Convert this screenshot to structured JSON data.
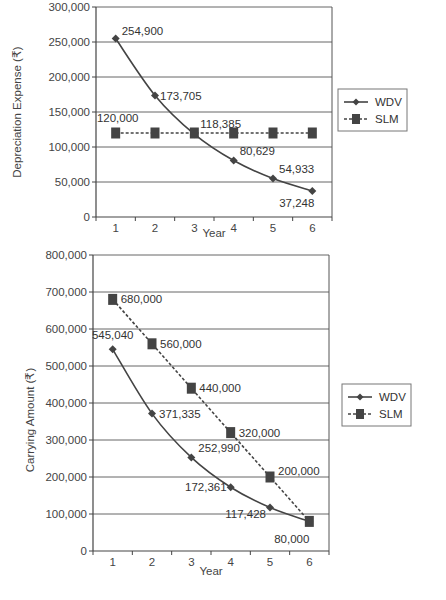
{
  "chart_data": [
    {
      "type": "line",
      "title": "",
      "xlabel": "Year",
      "ylabel": "Depreciation Expense (₹)",
      "categories": [
        "1",
        "2",
        "3",
        "4",
        "5",
        "6"
      ],
      "ylim": [
        0,
        300000
      ],
      "yticks": [
        "0",
        "50,000",
        "100,000",
        "150,000",
        "200,000",
        "250,000",
        "300,000"
      ],
      "grid": true,
      "legend_position": "right",
      "series": [
        {
          "name": "WDV",
          "style": "solid, diamond markers",
          "values": [
            254900,
            173705,
            118385,
            80629,
            54933,
            37248
          ],
          "labels": [
            "254,900",
            "173,705",
            "118,385",
            "80,629",
            "54,933",
            "37,248"
          ]
        },
        {
          "name": "SLM",
          "style": "dashed, square markers",
          "values": [
            120000,
            120000,
            120000,
            120000,
            120000,
            120000
          ],
          "labels": [
            "120,000"
          ]
        }
      ]
    },
    {
      "type": "line",
      "title": "",
      "xlabel": "Year",
      "ylabel": "Carrying Amount (₹)",
      "categories": [
        "1",
        "2",
        "3",
        "4",
        "5",
        "6"
      ],
      "ylim": [
        0,
        800000
      ],
      "yticks": [
        "0",
        "100,000",
        "200,000",
        "300,000",
        "400,000",
        "500,000",
        "600,000",
        "700,000",
        "800,000"
      ],
      "grid": true,
      "legend_position": "right",
      "series": [
        {
          "name": "WDV",
          "style": "solid, diamond markers",
          "values": [
            545040,
            371335,
            252990,
            172361,
            117428,
            80000
          ],
          "labels": [
            "545,040",
            "371,335",
            "252,990",
            "172,361",
            "117,428",
            "80,000"
          ]
        },
        {
          "name": "SLM",
          "style": "dashed, square markers",
          "values": [
            680000,
            560000,
            440000,
            320000,
            200000,
            80000
          ],
          "labels": [
            "680,000",
            "560,000",
            "440,000",
            "320,000",
            "200,000",
            "80,000"
          ]
        }
      ]
    }
  ],
  "charts": {
    "top": {
      "ylabel": "Depreciation Expense (₹)",
      "xlabel": "Year",
      "legend": {
        "wdv": "WDV",
        "slm": "SLM"
      }
    },
    "bottom": {
      "ylabel": "Carrying Amount (₹)",
      "xlabel": "Year",
      "legend": {
        "wdv": "WDV",
        "slm": "SLM"
      }
    }
  }
}
